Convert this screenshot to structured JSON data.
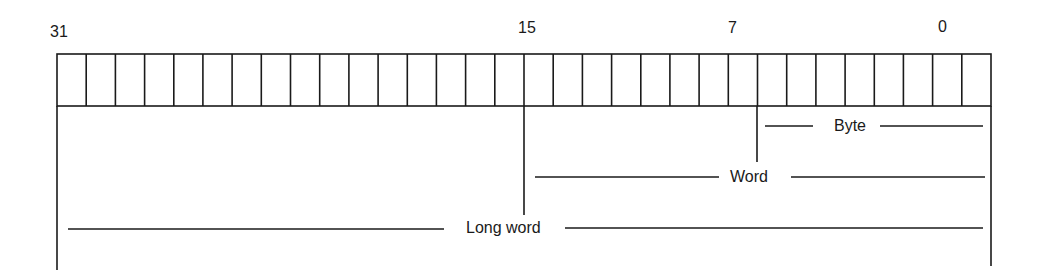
{
  "diagram": {
    "type": "register-data-size-layout",
    "total_bits": 32,
    "bit_labels": [
      {
        "bit": "31",
        "x": 50
      },
      {
        "bit": "15",
        "x": 518
      },
      {
        "bit": "7",
        "x": 728
      },
      {
        "bit": "0",
        "x": 938
      }
    ],
    "segments": [
      {
        "label": "Byte",
        "from_bit": 7,
        "to_bit": 0
      },
      {
        "label": "Word",
        "from_bit": 15,
        "to_bit": 0
      },
      {
        "label": "Long word",
        "from_bit": 31,
        "to_bit": 0
      }
    ],
    "colors": {
      "line": "#1a1a1a",
      "background": "#ffffff"
    }
  }
}
